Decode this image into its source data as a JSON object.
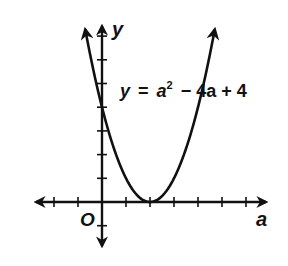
{
  "chart_data": {
    "type": "line",
    "title": "",
    "xlabel": "a",
    "ylabel": "y",
    "origin_label": "O",
    "equation": "y = a² − 4a + 4",
    "equation_parts": {
      "lhs": "y",
      "eq": "=",
      "base": "a",
      "exp": "2",
      "rest": "− 4a + 4"
    },
    "function": "a^2 - 4a + 4",
    "vertex": [
      2,
      0
    ],
    "y_intercept": [
      0,
      4
    ],
    "xlim": [
      -3,
      7
    ],
    "ylim": [
      -2,
      7
    ],
    "x_ticks": [
      -2,
      -1,
      1,
      2,
      3,
      4,
      5,
      6
    ],
    "y_ticks": [
      -1,
      1,
      2,
      3,
      4,
      5,
      6,
      7
    ],
    "grid": false,
    "series": [
      {
        "name": "y = a^2 - 4a + 4",
        "x": [
          -0.7,
          0,
          1,
          2,
          3,
          4,
          4.7
        ],
        "y": [
          7.29,
          4,
          1,
          0,
          1,
          4,
          7.29
        ]
      }
    ],
    "arrows": [
      "both ends of curve",
      "both ends of a-axis",
      "both ends of y-axis"
    ],
    "colors": {
      "ink": "#111111",
      "background": "#ffffff"
    }
  }
}
